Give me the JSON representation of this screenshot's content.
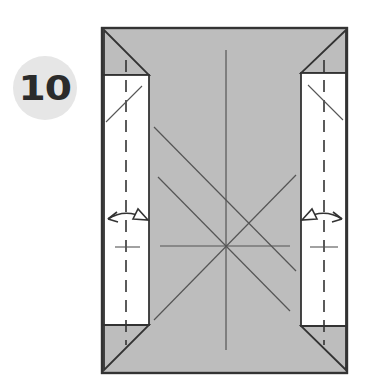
{
  "step": {
    "number": "10",
    "badge_color": "#e6e6e6",
    "number_color": "#2b2b2b"
  },
  "diagram": {
    "paper_color": "#bdbdbd",
    "flap_color": "#ffffff",
    "line_color": "#333333",
    "crease_color": "#555555",
    "outer_rect": {
      "x": 102,
      "y": 28,
      "w": 245,
      "h": 345
    },
    "left_flap": {
      "x": 104,
      "y": 74,
      "w": 45,
      "h": 251
    },
    "right_flap": {
      "x": 301,
      "y": 73,
      "w": 45,
      "h": 253
    },
    "left_arrow_label": "unfold-refold-arrow",
    "right_arrow_label": "unfold-refold-arrow"
  }
}
